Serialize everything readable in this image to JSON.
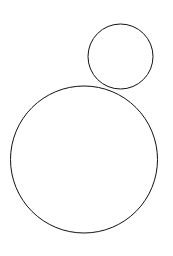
{
  "canvas": {
    "width": 173,
    "height": 256,
    "background_color": "#ffffff"
  },
  "figure": {
    "title": "",
    "shapes": [
      {
        "name": "small-circle",
        "type": "circle",
        "cx": 120.5,
        "cy": 56.5,
        "r": 32.5,
        "stroke_color": "#111111",
        "stroke_width": 1,
        "fill": "none",
        "bounds": {
          "left": 88,
          "top": 24,
          "right": 153,
          "bottom": 89
        }
      },
      {
        "name": "large-circle",
        "type": "circle",
        "cx": 84,
        "cy": 159.5,
        "r": 73.5,
        "stroke_color": "#111111",
        "stroke_width": 1,
        "fill": "none",
        "bounds": {
          "left": 10.5,
          "top": 86,
          "right": 157.5,
          "bottom": 233
        }
      }
    ]
  },
  "chart_data": {
    "type": "scatter",
    "title": "",
    "xlabel": "",
    "ylabel": "",
    "grid": false,
    "legend": "none",
    "xlim": [
      0,
      173
    ],
    "ylim": [
      0,
      256
    ],
    "series": [
      {
        "name": "small-circle",
        "shape": "circle",
        "center": [
          120.5,
          56.5
        ],
        "radius": 32.5,
        "diameter": 65,
        "stroke": "#111111"
      },
      {
        "name": "large-circle",
        "shape": "circle",
        "center": [
          84,
          159.5
        ],
        "radius": 73.5,
        "diameter": 147,
        "stroke": "#111111"
      }
    ]
  }
}
